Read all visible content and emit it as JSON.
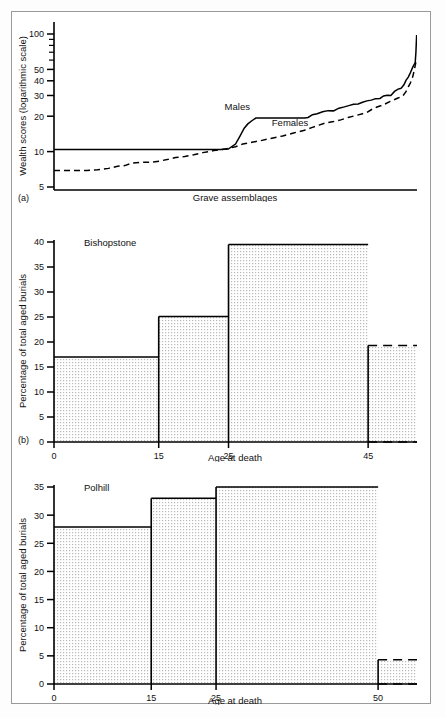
{
  "figure": {
    "panel_a_label": "(a)",
    "panel_b_label": "(b)",
    "accent_color": "#000000",
    "fill_color": "#e9e9e9"
  },
  "chart_data": [
    {
      "id": "wealth",
      "type": "line",
      "title": "",
      "xlabel": "Grave assemblages",
      "ylabel": "Wealth scores (logarithmic scale)",
      "yscale": "log",
      "ylim": [
        4,
        100
      ],
      "yticks": [
        5,
        10,
        20,
        30,
        40,
        50,
        100
      ],
      "ytick_labels": [
        "5",
        "10",
        "20",
        "30",
        "40",
        "50",
        "100"
      ],
      "yminor_ticks": [
        60,
        70,
        80,
        90
      ],
      "grid": false,
      "legend": "inline-annotation",
      "annotations": [
        {
          "text": "Males",
          "x": 0.47,
          "y": 21.5
        },
        {
          "text": "Females",
          "x": 0.6,
          "y": 15.5
        }
      ],
      "series": [
        {
          "name": "Males",
          "style": "solid",
          "points": [
            [
              0.0,
              10.4
            ],
            [
              0.06,
              10.4
            ],
            [
              0.12,
              10.4
            ],
            [
              0.18,
              10.4
            ],
            [
              0.24,
              10.4
            ],
            [
              0.3,
              10.4
            ],
            [
              0.36,
              10.4
            ],
            [
              0.42,
              10.4
            ],
            [
              0.46,
              10.4
            ],
            [
              0.48,
              10.5
            ],
            [
              0.5,
              11.6
            ],
            [
              0.512,
              13.5
            ],
            [
              0.524,
              15.8
            ],
            [
              0.534,
              17.2
            ],
            [
              0.545,
              18.3
            ],
            [
              0.556,
              19.3
            ],
            [
              0.6,
              19.3
            ],
            [
              0.65,
              19.3
            ],
            [
              0.69,
              19.3
            ],
            [
              0.7,
              19.5
            ],
            [
              0.712,
              20.6
            ],
            [
              0.725,
              21.0
            ],
            [
              0.74,
              21.8
            ],
            [
              0.755,
              22.3
            ],
            [
              0.77,
              22.2
            ],
            [
              0.785,
              23.4
            ],
            [
              0.8,
              24.0
            ],
            [
              0.812,
              24.6
            ],
            [
              0.825,
              25.3
            ],
            [
              0.838,
              25.4
            ],
            [
              0.85,
              26.3
            ],
            [
              0.862,
              27.0
            ],
            [
              0.874,
              27.4
            ],
            [
              0.886,
              28.2
            ],
            [
              0.898,
              28.3
            ],
            [
              0.908,
              29.7
            ],
            [
              0.918,
              30.2
            ],
            [
              0.928,
              30.0
            ],
            [
              0.938,
              32.5
            ],
            [
              0.948,
              34.0
            ],
            [
              0.956,
              34.5
            ],
            [
              0.964,
              37.0
            ],
            [
              0.97,
              40.5
            ],
            [
              0.976,
              43.0
            ],
            [
              0.982,
              47.0
            ],
            [
              0.988,
              52.0
            ],
            [
              0.992,
              55.0
            ],
            [
              0.995,
              57.0
            ],
            [
              0.997,
              70.0
            ],
            [
              0.999,
              98.0
            ]
          ]
        },
        {
          "name": "Females",
          "style": "dashed",
          "points": [
            [
              0.0,
              6.9
            ],
            [
              0.05,
              6.9
            ],
            [
              0.09,
              6.9
            ],
            [
              0.12,
              7.0
            ],
            [
              0.15,
              7.2
            ],
            [
              0.175,
              7.5
            ],
            [
              0.195,
              7.6
            ],
            [
              0.215,
              8.0
            ],
            [
              0.24,
              8.1
            ],
            [
              0.265,
              8.1
            ],
            [
              0.29,
              8.3
            ],
            [
              0.315,
              8.6
            ],
            [
              0.335,
              8.9
            ],
            [
              0.36,
              9.1
            ],
            [
              0.385,
              9.4
            ],
            [
              0.41,
              9.8
            ],
            [
              0.44,
              10.2
            ],
            [
              0.47,
              10.5
            ],
            [
              0.5,
              11.0
            ],
            [
              0.52,
              11.6
            ],
            [
              0.545,
              12.0
            ],
            [
              0.57,
              12.4
            ],
            [
              0.6,
              13.0
            ],
            [
              0.63,
              13.6
            ],
            [
              0.66,
              14.4
            ],
            [
              0.69,
              15.2
            ],
            [
              0.71,
              16.0
            ],
            [
              0.73,
              16.8
            ],
            [
              0.75,
              17.6
            ],
            [
              0.77,
              18.0
            ],
            [
              0.79,
              18.6
            ],
            [
              0.81,
              19.5
            ],
            [
              0.83,
              20.2
            ],
            [
              0.85,
              21.0
            ],
            [
              0.862,
              21.5
            ],
            [
              0.875,
              22.8
            ],
            [
              0.888,
              23.8
            ],
            [
              0.9,
              24.5
            ],
            [
              0.912,
              25.4
            ],
            [
              0.925,
              26.6
            ],
            [
              0.936,
              27.5
            ],
            [
              0.946,
              28.4
            ],
            [
              0.955,
              29.2
            ],
            [
              0.962,
              30.0
            ],
            [
              0.97,
              32.5
            ],
            [
              0.976,
              35.5
            ],
            [
              0.982,
              38.5
            ],
            [
              0.988,
              43.0
            ],
            [
              0.993,
              50.0
            ],
            [
              0.997,
              58.0
            ],
            [
              1.0,
              62.0
            ]
          ]
        }
      ]
    },
    {
      "id": "bishopstone",
      "type": "bar",
      "title": "Bishopstone",
      "xlabel": "Age at death",
      "ylabel": "Percentage of total aged burials",
      "ylim": [
        0,
        40
      ],
      "yticks": [
        0,
        5,
        10,
        15,
        20,
        25,
        30,
        35,
        40
      ],
      "xticks": [
        0,
        15,
        25,
        45
      ],
      "xtick_labels": [
        "0",
        "15",
        "25",
        "45"
      ],
      "xlim": [
        0,
        52
      ],
      "grid": false,
      "bars": [
        {
          "from": 0,
          "to": 15,
          "value": 17.0,
          "open_ended": false
        },
        {
          "from": 15,
          "to": 25,
          "value": 25.1,
          "open_ended": false
        },
        {
          "from": 25,
          "to": 45,
          "value": 39.5,
          "open_ended": false
        },
        {
          "from": 45,
          "to": 52,
          "value": 19.3,
          "open_ended": true
        }
      ]
    },
    {
      "id": "polhill",
      "type": "bar",
      "title": "Polhill",
      "xlabel": "Age at death",
      "ylabel": "Percentage of total aged burials",
      "ylim": [
        0,
        35
      ],
      "yticks": [
        0,
        5,
        10,
        15,
        20,
        25,
        30,
        35
      ],
      "xticks": [
        0,
        15,
        25,
        50
      ],
      "xtick_labels": [
        "0",
        "15",
        "25",
        "50"
      ],
      "xlim": [
        0,
        56
      ],
      "grid": false,
      "bars": [
        {
          "from": 0,
          "to": 15,
          "value": 27.9,
          "open_ended": false
        },
        {
          "from": 15,
          "to": 25,
          "value": 33.0,
          "open_ended": false
        },
        {
          "from": 25,
          "to": 50,
          "value": 35.0,
          "open_ended": false
        },
        {
          "from": 50,
          "to": 56,
          "value": 4.3,
          "open_ended": true
        }
      ]
    }
  ]
}
